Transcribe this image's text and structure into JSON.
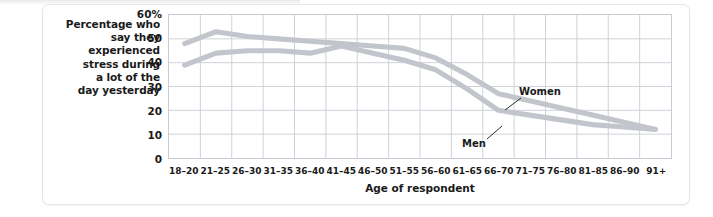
{
  "chart_data": {
    "type": "line",
    "title": "",
    "ylabel": "Percentage who say they experienced stress during a lot of the day yesterday",
    "xlabel": "Age of respondent",
    "ylim": [
      0,
      60
    ],
    "grid": true,
    "legend_position": "inline-annotation",
    "categories": [
      "18–20",
      "21–25",
      "26–30",
      "31–35",
      "36–40",
      "41–45",
      "46–50",
      "51–55",
      "56–60",
      "61–65",
      "66–70",
      "71–75",
      "76–80",
      "81–85",
      "86–90",
      "91+"
    ],
    "series": [
      {
        "name": "Women",
        "color": "#c2c6cc",
        "values": [
          48,
          53,
          51,
          50,
          49,
          48,
          47,
          46,
          42,
          35,
          27,
          24,
          21,
          18,
          15,
          12
        ]
      },
      {
        "name": "Men",
        "color": "#c2c6cc",
        "values": [
          39,
          44,
          45,
          45,
          44,
          47,
          44,
          41,
          37,
          29,
          20,
          18,
          16,
          14,
          13,
          12
        ]
      }
    ],
    "y_ticks": [
      {
        "value": 60,
        "label": "60%"
      },
      {
        "value": 50,
        "label": "50"
      },
      {
        "value": 40,
        "label": "40"
      },
      {
        "value": 30,
        "label": "30"
      },
      {
        "value": 20,
        "label": "20"
      },
      {
        "value": 10,
        "label": "10"
      },
      {
        "value": 0,
        "label": "0"
      }
    ],
    "annotations": [
      {
        "text": "Women",
        "series": "Women"
      },
      {
        "text": "Men",
        "series": "Men"
      }
    ]
  },
  "axis": {
    "y_caption_lines": [
      "Percentage who",
      "say they",
      "experienced",
      "stress during",
      "a lot of the",
      "day yesterday"
    ],
    "x_title": "Age of respondent"
  },
  "colors": {
    "series_line": "#c2c6cc",
    "grid": "#c9ccd4",
    "frame": "#c9ccd4",
    "text": "#1a1a1a",
    "card_bg": "#ffffff",
    "page_bg": "#ffffff"
  }
}
